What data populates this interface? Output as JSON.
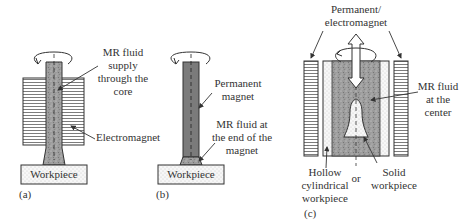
{
  "figure": {
    "panel_a": {
      "caption": "(a)",
      "label_fluid": [
        "MR fluid",
        "supply",
        "through the",
        "core"
      ],
      "label_magnet": "Electromagnet",
      "workpiece": "Workpiece"
    },
    "panel_b": {
      "caption": "(b)",
      "label_magnet": [
        "Permanent",
        "magnet"
      ],
      "label_fluid": [
        "MR fluid at",
        "the end of the",
        "magnet"
      ],
      "workpiece": "Workpiece"
    },
    "panel_c": {
      "caption": "(c)",
      "label_magnet": [
        "Permanent/",
        "electromagnet"
      ],
      "label_fluid": [
        "MR fluid",
        "at the",
        "center"
      ],
      "label_hollow": [
        "Hollow",
        "cylindrical",
        "workpiece"
      ],
      "label_or": "or",
      "label_solid": [
        "Solid",
        "workpiece"
      ]
    }
  },
  "colors": {
    "stroke": "#333333",
    "fluid_fill": "#9a9a9a",
    "magnet_dark": "#707070",
    "workpiece_fill": "#f2f2f2"
  }
}
